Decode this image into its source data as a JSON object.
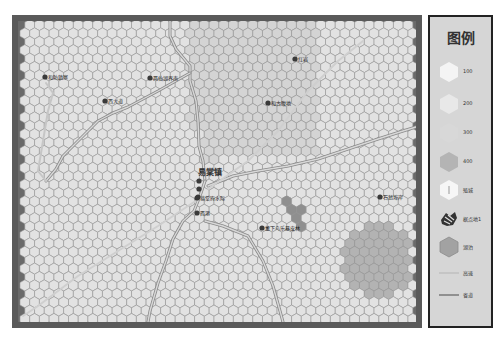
{
  "map": {
    "town_label": "易棠镇",
    "places": [
      {
        "name": "和防鎮寨",
        "x": 45,
        "y": 77
      },
      {
        "name": "两仙湖界南",
        "x": 150,
        "y": 78
      },
      {
        "name": "西大道",
        "x": 105,
        "y": 101
      },
      {
        "name": "红岩",
        "x": 295,
        "y": 59
      },
      {
        "name": "和古腹地",
        "x": 268,
        "y": 103
      },
      {
        "name": "易棠府水际",
        "x": 197,
        "y": 198
      },
      {
        "name": "西港",
        "x": 197,
        "y": 213
      },
      {
        "name": "董下鸟乐暴皮林",
        "x": 262,
        "y": 228
      },
      {
        "name": "石翁埠岸",
        "x": 380,
        "y": 197
      }
    ],
    "colors": {
      "frame": "#5a5a5a",
      "hex_fill": "#e2e2e2",
      "hex_stroke": "#9a9a9a",
      "elev_200": "#d4d4d4",
      "lake": "#b3b3b3",
      "elev_400": "#8f8f8f",
      "road_highway": "#c8c8c8",
      "road_provincial": "#a8a8a8"
    }
  },
  "legend": {
    "title": "图例",
    "items": [
      {
        "label": "100",
        "symbol": "hex-100",
        "color": "#f0f0f0"
      },
      {
        "label": "200",
        "symbol": "hex-200",
        "color": "#e6e6e6"
      },
      {
        "label": "300",
        "symbol": "hex-300",
        "color": "#d6d6d6"
      },
      {
        "label": "400",
        "symbol": "hex-400",
        "color": "#a8a8a8"
      },
      {
        "label": "殖城",
        "symbol": "town-hex",
        "color": "#f4f4f4"
      },
      {
        "label": "据点地1",
        "symbol": "stronghold",
        "color": "#333333"
      },
      {
        "label": "湖泊",
        "symbol": "lake-hex",
        "color": "#a0a0a0"
      },
      {
        "label": "高速",
        "symbol": "highway-line",
        "color": "#c4c4c4"
      },
      {
        "label": "省道",
        "symbol": "provincial-line",
        "color": "#8a8a8a"
      }
    ]
  }
}
